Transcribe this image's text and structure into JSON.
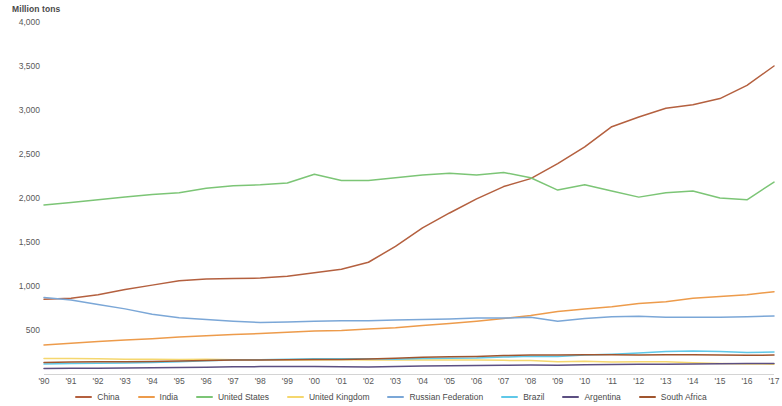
{
  "chart_data": {
    "type": "line",
    "title": "",
    "subtitle": "",
    "unit_caption": "Million tons",
    "ylabel": "Million tons",
    "xlabel": "",
    "ylim": [
      0,
      4000
    ],
    "y_ticks": [
      "0",
      "500",
      "1,000",
      "1,500",
      "2,000",
      "2,500",
      "3,000",
      "3,500",
      "4,000"
    ],
    "y_tick_values": [
      0,
      500,
      1000,
      1500,
      2000,
      2500,
      3000,
      3500,
      4000
    ],
    "grid": false,
    "legend_position": "bottom",
    "categories": [
      "'90",
      "'91",
      "'92",
      "'93",
      "'94",
      "'95",
      "'96",
      "'97",
      "'98",
      "'99",
      "'00",
      "'01",
      "'02",
      "'03",
      "'04",
      "'05",
      "'06",
      "'07",
      "'08",
      "'09",
      "'10",
      "'11",
      "'12",
      "'13",
      "'14",
      "'15",
      "'16",
      "'17"
    ],
    "x": [
      1990,
      1991,
      1992,
      1993,
      1994,
      1995,
      1996,
      1997,
      1998,
      1999,
      2000,
      2001,
      2002,
      2003,
      2004,
      2005,
      2006,
      2007,
      2008,
      2009,
      2010,
      2011,
      2012,
      2013,
      2014,
      2015,
      2016,
      2017
    ],
    "series": [
      {
        "name": "China",
        "color": "#b4603f",
        "values": [
          850,
          860,
          900,
          960,
          1010,
          1060,
          1080,
          1085,
          1090,
          1110,
          1150,
          1190,
          1270,
          1450,
          1660,
          1830,
          1990,
          2130,
          2220,
          2390,
          2580,
          2810,
          2920,
          3020,
          3060,
          3130,
          3280,
          3500
        ]
      },
      {
        "name": "India",
        "color": "#ed9b4b",
        "values": [
          330,
          350,
          370,
          385,
          400,
          420,
          435,
          450,
          460,
          475,
          490,
          495,
          510,
          525,
          550,
          575,
          600,
          630,
          665,
          710,
          740,
          765,
          800,
          820,
          860,
          880,
          900,
          935
        ]
      },
      {
        "name": "United States",
        "color": "#7cc576",
        "values": [
          1920,
          1950,
          1980,
          2010,
          2040,
          2060,
          2110,
          2140,
          2150,
          2170,
          2270,
          2200,
          2200,
          2230,
          2260,
          2280,
          2260,
          2290,
          2230,
          2090,
          2150,
          2080,
          2010,
          2060,
          2080,
          2000,
          1980,
          2180
        ]
      },
      {
        "name": "United Kingdom",
        "color": "#f5d76e",
        "values": [
          175,
          175,
          172,
          168,
          168,
          165,
          168,
          162,
          162,
          158,
          160,
          162,
          158,
          160,
          160,
          158,
          158,
          155,
          152,
          140,
          145,
          135,
          140,
          138,
          128,
          120,
          115,
          112
        ]
      },
      {
        "name": "Russian Federation",
        "color": "#7ba7d7"
      },
      {
        "name": "Brazil",
        "color": "#5fc8e8"
      },
      {
        "name": "Argentina",
        "color": "#5c4f82"
      },
      {
        "name": "South Africa",
        "color": "#a0552e"
      }
    ],
    "series_values": {
      "Russian Federation": [
        870,
        840,
        790,
        740,
        680,
        640,
        620,
        600,
        585,
        590,
        600,
        605,
        605,
        615,
        620,
        625,
        635,
        635,
        645,
        600,
        630,
        650,
        655,
        645,
        645,
        645,
        650,
        660
      ],
      "Brazil": [
        115,
        120,
        122,
        126,
        132,
        140,
        150,
        158,
        163,
        168,
        172,
        172,
        172,
        168,
        175,
        180,
        182,
        192,
        202,
        198,
        215,
        225,
        240,
        255,
        262,
        255,
        245,
        250
      ],
      "Argentina": [
        62,
        64,
        66,
        68,
        72,
        74,
        78,
        82,
        84,
        85,
        86,
        82,
        80,
        85,
        90,
        94,
        96,
        100,
        102,
        100,
        105,
        108,
        110,
        112,
        114,
        116,
        118,
        120
      ],
      "South Africa": [
        130,
        135,
        138,
        140,
        143,
        148,
        152,
        158,
        160,
        162,
        164,
        166,
        170,
        180,
        190,
        195,
        200,
        210,
        215,
        215,
        220,
        218,
        215,
        218,
        220,
        215,
        212,
        215
      ]
    }
  },
  "legend": {
    "items": [
      {
        "label": "China",
        "color": "#b4603f"
      },
      {
        "label": "India",
        "color": "#ed9b4b"
      },
      {
        "label": "United States",
        "color": "#7cc576"
      },
      {
        "label": "United Kingdom",
        "color": "#f5d76e"
      },
      {
        "label": "Russian Federation",
        "color": "#7ba7d7"
      },
      {
        "label": "Brazil",
        "color": "#5fc8e8"
      },
      {
        "label": "Argentina",
        "color": "#5c4f82"
      },
      {
        "label": "South Africa",
        "color": "#a0552e"
      }
    ]
  }
}
